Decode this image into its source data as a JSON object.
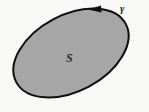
{
  "figure": {
    "background_color": "#fbfbfa",
    "region": {
      "label": "S",
      "shape": "ellipse",
      "fill_color": "#a8a8a8",
      "stroke_color": "#0f0f0f",
      "stroke_width": 2,
      "center_x": 71,
      "center_y": 53,
      "radius_x": 62,
      "radius_y": 38,
      "rotation_deg": -28
    },
    "curve": {
      "label": "γ",
      "orientation": "counterclockwise",
      "arrow": {
        "name": "direction-arrowhead",
        "x": 101,
        "y": 9,
        "direction": "left",
        "color": "#0f0f0f"
      }
    }
  }
}
